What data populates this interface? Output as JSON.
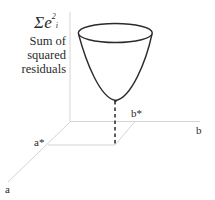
{
  "diagram": {
    "y_axis": {
      "symbol": "Σe",
      "symbol_subscript": "i",
      "symbol_superscript": "2",
      "label_lines": [
        "Sum of",
        "squared",
        "residuals"
      ]
    },
    "a_axis": {
      "label": "a"
    },
    "b_axis": {
      "label": "b"
    },
    "a_star": {
      "label": "a*"
    },
    "b_star": {
      "label": "b*"
    },
    "colors": {
      "axis": "#d0d0d0",
      "bowl": "#2b2b2b",
      "dashed": "#333333",
      "text": "#2a2a2a"
    }
  }
}
